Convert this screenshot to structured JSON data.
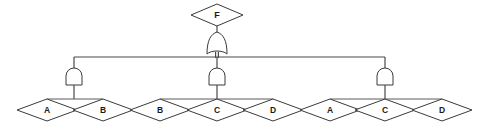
{
  "diagram": {
    "background_color": "#ffffff",
    "line_color": "#4a4a4a",
    "shape_fill": "#ffffff",
    "shape_stroke": "#3a3a3a",
    "text_color": "#1a1a1a",
    "top_event": {
      "label": "F",
      "shape": "diamond",
      "cx": 217,
      "cy": 15,
      "rx": 26,
      "ry": 11
    },
    "top_gate": {
      "type": "or-gate",
      "cx": 217,
      "cy": 44,
      "w": 20,
      "h": 20
    },
    "bus": {
      "y": 57,
      "x_start": 74,
      "x_end": 385
    },
    "gates": [
      {
        "id": "and-gate-left",
        "type": "and-gate",
        "cx": 74,
        "cy": 76,
        "w": 17,
        "h": 17
      },
      {
        "id": "and-gate-middle",
        "type": "and-gate",
        "cx": 217,
        "cy": 76,
        "w": 17,
        "h": 17
      },
      {
        "id": "and-gate-right",
        "type": "and-gate",
        "cx": 385,
        "cy": 76,
        "w": 17,
        "h": 17
      }
    ],
    "groups": [
      {
        "id": "group-left",
        "gate": "and-gate-left",
        "span": {
          "x_start": 47,
          "x_end": 103,
          "y": 99
        },
        "events": [
          {
            "label": "A",
            "cx": 47,
            "cy": 110,
            "rx": 30,
            "ry": 12
          },
          {
            "label": "B",
            "cx": 103,
            "cy": 110,
            "rx": 30,
            "ry": 12
          }
        ]
      },
      {
        "id": "group-middle",
        "gate": "and-gate-middle",
        "span": {
          "x_start": 160,
          "x_end": 273,
          "y": 99
        },
        "events": [
          {
            "label": "B",
            "cx": 160,
            "cy": 110,
            "rx": 30,
            "ry": 12
          },
          {
            "label": "C",
            "cx": 217,
            "cy": 110,
            "rx": 30,
            "ry": 12
          },
          {
            "label": "D",
            "cx": 273,
            "cy": 110,
            "rx": 30,
            "ry": 12
          }
        ]
      },
      {
        "id": "group-right",
        "gate": "and-gate-right",
        "span": {
          "x_start": 330,
          "x_end": 442,
          "y": 99
        },
        "events": [
          {
            "label": "A",
            "cx": 330,
            "cy": 110,
            "rx": 30,
            "ry": 12
          },
          {
            "label": "C",
            "cx": 385,
            "cy": 110,
            "rx": 30,
            "ry": 12
          },
          {
            "label": "D",
            "cx": 442,
            "cy": 110,
            "rx": 30,
            "ry": 12
          }
        ]
      }
    ],
    "labels": {
      "top": "F",
      "left_1": "A",
      "left_2": "B",
      "mid_1": "B",
      "mid_2": "C",
      "mid_3": "D",
      "right_1": "A",
      "right_2": "C",
      "right_3": "D"
    }
  }
}
